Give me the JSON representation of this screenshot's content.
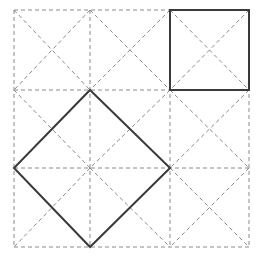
{
  "figure": {
    "canvas": {
      "width": 264,
      "height": 267,
      "background_color": "#ffffff"
    },
    "styles": {
      "dashed_color": "#8a8a8a",
      "dashed_width": 1,
      "dashed_pattern": "4 3",
      "solid_color": "#3a3a3a",
      "solid_width": 2
    },
    "grid": {
      "label": "dashed construction grid",
      "columns": 3,
      "rows": 3,
      "x_coords": [
        14,
        90,
        170,
        249
      ],
      "y_coords": [
        10,
        90,
        168,
        247
      ],
      "cell_diagonals": true,
      "vertical_lines": [
        {
          "x1": 14,
          "y1": 10,
          "x2": 14,
          "y2": 247
        },
        {
          "x1": 90,
          "y1": 10,
          "x2": 90,
          "y2": 247
        },
        {
          "x1": 170,
          "y1": 10,
          "x2": 170,
          "y2": 247
        },
        {
          "x1": 249,
          "y1": 10,
          "x2": 249,
          "y2": 247
        }
      ],
      "horizontal_lines": [
        {
          "x1": 14,
          "y1": 10,
          "x2": 249,
          "y2": 10
        },
        {
          "x1": 14,
          "y1": 90,
          "x2": 249,
          "y2": 90
        },
        {
          "x1": 14,
          "y1": 168,
          "x2": 249,
          "y2": 168
        },
        {
          "x1": 14,
          "y1": 247,
          "x2": 249,
          "y2": 247
        }
      ],
      "diagonals": [
        {
          "x1": 14,
          "y1": 10,
          "x2": 90,
          "y2": 90
        },
        {
          "x1": 90,
          "y1": 10,
          "x2": 14,
          "y2": 90
        },
        {
          "x1": 90,
          "y1": 10,
          "x2": 170,
          "y2": 90
        },
        {
          "x1": 170,
          "y1": 10,
          "x2": 90,
          "y2": 90
        },
        {
          "x1": 170,
          "y1": 10,
          "x2": 249,
          "y2": 90
        },
        {
          "x1": 249,
          "y1": 10,
          "x2": 170,
          "y2": 90
        },
        {
          "x1": 14,
          "y1": 90,
          "x2": 90,
          "y2": 168
        },
        {
          "x1": 90,
          "y1": 90,
          "x2": 14,
          "y2": 168
        },
        {
          "x1": 90,
          "y1": 90,
          "x2": 170,
          "y2": 168
        },
        {
          "x1": 170,
          "y1": 90,
          "x2": 90,
          "y2": 168
        },
        {
          "x1": 170,
          "y1": 90,
          "x2": 249,
          "y2": 168
        },
        {
          "x1": 249,
          "y1": 90,
          "x2": 170,
          "y2": 168
        },
        {
          "x1": 14,
          "y1": 168,
          "x2": 90,
          "y2": 247
        },
        {
          "x1": 90,
          "y1": 168,
          "x2": 14,
          "y2": 247
        },
        {
          "x1": 90,
          "y1": 168,
          "x2": 170,
          "y2": 247
        },
        {
          "x1": 170,
          "y1": 168,
          "x2": 90,
          "y2": 247
        },
        {
          "x1": 170,
          "y1": 168,
          "x2": 249,
          "y2": 247
        },
        {
          "x1": 249,
          "y1": 168,
          "x2": 170,
          "y2": 247
        }
      ]
    },
    "shapes": [
      {
        "name": "small-square",
        "label": "small solid square in top-right cell",
        "points": "170,10 249,10 249,90 170,90",
        "vertices": [
          [
            170,
            10
          ],
          [
            249,
            10
          ],
          [
            249,
            90
          ],
          [
            170,
            90
          ]
        ],
        "side_length_px": 79
      },
      {
        "name": "large-diamond",
        "label": "large solid tilted square (diamond)",
        "points": "90,90 170,168 90,247 14,168",
        "vertices": [
          [
            90,
            90
          ],
          [
            170,
            168
          ],
          [
            90,
            247
          ],
          [
            14,
            168
          ]
        ],
        "side_length_px": 111
      }
    ]
  }
}
